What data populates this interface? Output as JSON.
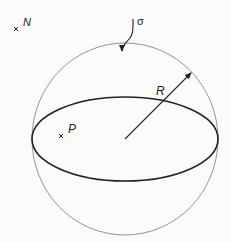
{
  "diagram": {
    "labels": {
      "N": "N",
      "sigma": "σ",
      "R": "R",
      "P": "P"
    },
    "geometry": {
      "center": [
        125,
        139
      ],
      "sphere_radius": 94,
      "equator_rx": 93,
      "equator_ry": 42,
      "radius_arrow_end": [
        192,
        72
      ],
      "point_N": [
        16,
        29
      ],
      "point_P": [
        61,
        136
      ]
    },
    "colors": {
      "sphere_outline": "#8a8a8a",
      "equator": "#222222",
      "ink": "#222222",
      "background": "#fbfbfb"
    }
  }
}
